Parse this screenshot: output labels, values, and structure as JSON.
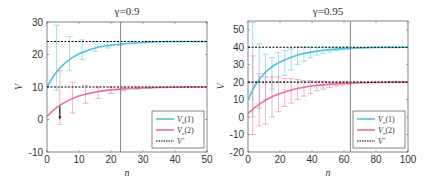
{
  "chart_data": [
    {
      "type": "line",
      "title": "γ = 0.9",
      "xlabel": "n",
      "ylabel": "V",
      "xlim": [
        0,
        50
      ],
      "ylim": [
        -10,
        30
      ],
      "xticks": [
        0,
        10,
        20,
        30,
        40,
        50
      ],
      "yticks": [
        -10,
        0,
        10,
        20,
        30
      ],
      "grid": false,
      "legend_position": "lower right",
      "vline_x": 23,
      "series": [
        {
          "name": "V_n(1)",
          "color": "#4fc1e0",
          "x": [
            0,
            2,
            4,
            6,
            8,
            10,
            12,
            14,
            16,
            18,
            20,
            25,
            30,
            35,
            40,
            45,
            50
          ],
          "values": [
            10,
            13.3,
            15.8,
            17.7,
            19.1,
            20.2,
            21.0,
            21.7,
            22.2,
            22.6,
            22.9,
            23.4,
            23.7,
            23.9,
            24.0,
            24.0,
            24.0
          ],
          "errorbars": [
            {
              "x": 3,
              "low": 9,
              "high": 29
            },
            {
              "x": 7,
              "low": 15,
              "high": 25.5
            },
            {
              "x": 11,
              "low": 18.5,
              "high": 24.5
            },
            {
              "x": 15,
              "low": 21,
              "high": 24
            },
            {
              "x": 19,
              "low": 22,
              "high": 24
            },
            {
              "x": 23,
              "low": 22.8,
              "high": 23.8
            },
            {
              "x": 27,
              "low": 23.3,
              "high": 24
            },
            {
              "x": 31,
              "low": 23.6,
              "high": 24
            }
          ]
        },
        {
          "name": "V_n(2)",
          "color": "#ef6f8f",
          "x": [
            0,
            2,
            4,
            6,
            8,
            10,
            12,
            14,
            16,
            18,
            20,
            25,
            30,
            35,
            40,
            45,
            50
          ],
          "values": [
            1,
            2.9,
            4.4,
            5.5,
            6.5,
            7.2,
            7.8,
            8.2,
            8.6,
            8.9,
            9.1,
            9.5,
            9.7,
            9.85,
            9.9,
            10,
            10
          ],
          "errorbars": [
            {
              "x": 4,
              "low": -1.5,
              "high": 15
            },
            {
              "x": 8,
              "low": 2,
              "high": 11.5
            },
            {
              "x": 12,
              "low": 5,
              "high": 10.5
            },
            {
              "x": 16,
              "low": 6.5,
              "high": 10
            },
            {
              "x": 20,
              "low": 8,
              "high": 10
            },
            {
              "x": 24,
              "low": 8.8,
              "high": 10
            },
            {
              "x": 28,
              "low": 9.3,
              "high": 10
            },
            {
              "x": 32,
              "low": 9.6,
              "high": 10
            }
          ]
        },
        {
          "name": "V*",
          "color": "#000000",
          "style": "dashed",
          "levels": [
            24,
            10
          ]
        }
      ],
      "annotations": [
        {
          "type": "arrow",
          "x": 4,
          "from": 4,
          "to": 0,
          "color": "#222222"
        }
      ]
    },
    {
      "type": "line",
      "title": "γ = 0.95",
      "xlabel": "n",
      "ylabel": "V",
      "xlim": [
        0,
        100
      ],
      "ylim": [
        -20,
        55
      ],
      "xticks": [
        0,
        20,
        40,
        60,
        80,
        100
      ],
      "yticks": [
        -20,
        -10,
        0,
        10,
        20,
        30,
        40,
        50
      ],
      "grid": false,
      "legend_position": "lower right",
      "vline_x": 64,
      "series": [
        {
          "name": "V_n(1)",
          "color": "#4fc1e0",
          "x": [
            0,
            4,
            8,
            12,
            16,
            20,
            25,
            30,
            35,
            40,
            45,
            50,
            55,
            60,
            70,
            80,
            90,
            100
          ],
          "values": [
            10,
            17.5,
            22.8,
            26.6,
            29.5,
            31.6,
            33.6,
            35.2,
            36.4,
            37.3,
            38.0,
            38.5,
            38.9,
            39.2,
            39.6,
            39.8,
            39.9,
            40
          ],
          "errorbars": [
            {
              "x": 3,
              "low": 0,
              "high": 54
            },
            {
              "x": 7,
              "low": 5,
              "high": 42
            },
            {
              "x": 11,
              "low": 10,
              "high": 36
            },
            {
              "x": 15,
              "low": 16,
              "high": 34
            },
            {
              "x": 19,
              "low": 20,
              "high": 37
            },
            {
              "x": 23,
              "low": 24,
              "high": 38
            },
            {
              "x": 27,
              "low": 27,
              "high": 39
            },
            {
              "x": 31,
              "low": 30,
              "high": 40
            },
            {
              "x": 35,
              "low": 32,
              "high": 40
            },
            {
              "x": 39,
              "low": 34,
              "high": 40
            },
            {
              "x": 43,
              "low": 35.5,
              "high": 40
            },
            {
              "x": 47,
              "low": 36.5,
              "high": 40
            },
            {
              "x": 51,
              "low": 37.3,
              "high": 40
            },
            {
              "x": 55,
              "low": 38,
              "high": 40
            },
            {
              "x": 59,
              "low": 38.5,
              "high": 40
            },
            {
              "x": 63,
              "low": 38.8,
              "high": 40
            }
          ]
        },
        {
          "name": "V_n(2)",
          "color": "#ef6f8f",
          "x": [
            0,
            4,
            8,
            12,
            16,
            20,
            25,
            30,
            35,
            40,
            45,
            50,
            55,
            60,
            70,
            80,
            90,
            100
          ],
          "values": [
            2,
            5.3,
            8.0,
            10.2,
            12.0,
            13.5,
            15.0,
            16.2,
            17.1,
            17.8,
            18.3,
            18.7,
            19.0,
            19.3,
            19.6,
            19.8,
            19.9,
            20
          ],
          "errorbars": [
            {
              "x": 3,
              "low": -10,
              "high": 35
            },
            {
              "x": 7,
              "low": -5,
              "high": 25
            },
            {
              "x": 11,
              "low": -4,
              "high": 23
            },
            {
              "x": 15,
              "low": 0,
              "high": 23
            },
            {
              "x": 19,
              "low": 3,
              "high": 23
            },
            {
              "x": 23,
              "low": 6,
              "high": 22
            },
            {
              "x": 27,
              "low": 8,
              "high": 22
            },
            {
              "x": 31,
              "low": 10,
              "high": 21.5
            },
            {
              "x": 35,
              "low": 12,
              "high": 21
            },
            {
              "x": 39,
              "low": 13.5,
              "high": 21
            },
            {
              "x": 43,
              "low": 15,
              "high": 20.5
            },
            {
              "x": 47,
              "low": 16,
              "high": 20.5
            },
            {
              "x": 51,
              "low": 17,
              "high": 20
            },
            {
              "x": 55,
              "low": 17.8,
              "high": 20
            },
            {
              "x": 59,
              "low": 18.3,
              "high": 20
            },
            {
              "x": 63,
              "low": 18.7,
              "high": 20
            }
          ]
        },
        {
          "name": "V*",
          "color": "#000000",
          "style": "dashed",
          "levels": [
            40,
            20
          ]
        }
      ]
    }
  ],
  "panels": [
    {
      "title": "γ = 0.9",
      "xlabel": "n",
      "ylabel": "V",
      "legend": [
        {
          "label": "V_n(1)",
          "color": "#4fc1e0"
        },
        {
          "label": "V_n(2)",
          "color": "#ef6f8f"
        },
        {
          "label": "V*",
          "color": "#000000"
        }
      ]
    },
    {
      "title": "γ = 0.95",
      "xlabel": "n",
      "ylabel": "V",
      "legend": [
        {
          "label": "V_n(1)",
          "color": "#4fc1e0"
        },
        {
          "label": "V_n(2)",
          "color": "#ef6f8f"
        },
        {
          "label": "V*",
          "color": "#000000"
        }
      ]
    }
  ]
}
